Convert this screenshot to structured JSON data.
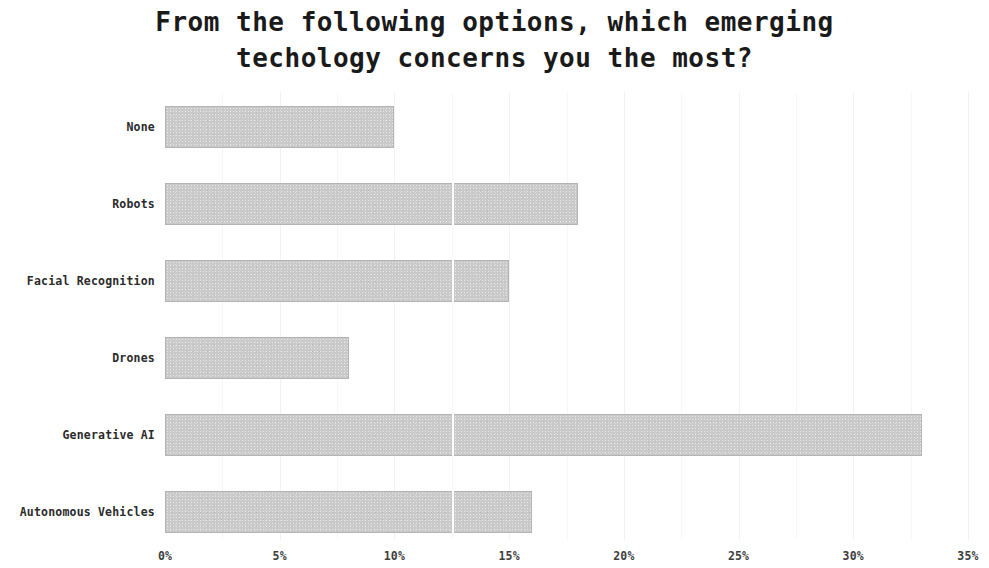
{
  "chart_data": {
    "type": "bar",
    "orientation": "horizontal",
    "title": "From the following options, which emerging\ntechology concerns you the most?",
    "title_line1": "From the following options, which emerging",
    "title_line2": "techology concerns you the most?",
    "xlabel": "",
    "ylabel": "",
    "categories": [
      "None",
      "Robots",
      "Facial Recognition",
      "Drones",
      "Generative AI",
      "Autonomous Vehicles"
    ],
    "values": [
      10,
      18,
      15,
      8,
      33,
      16
    ],
    "value_labels": [
      "10%",
      "18%",
      "15%",
      "8%",
      "33%",
      "16%"
    ],
    "xlim": [
      0,
      35
    ],
    "xtick_values": [
      0,
      5,
      10,
      15,
      20,
      25,
      30,
      35
    ],
    "xtick_labels": [
      "0%",
      "5%",
      "10%",
      "15%",
      "20%",
      "25%",
      "30%",
      "35%"
    ],
    "grid": true,
    "grid_axis": "x",
    "gridline_values": [
      2.5,
      5,
      7.5,
      10,
      12.5,
      15,
      17.5,
      20,
      22.5,
      25,
      27.5,
      30,
      32.5,
      35
    ],
    "legend": null,
    "bar_color": "#c9c9c9",
    "bar_edge_color": "#b4b4b4",
    "grid_color": "#f2f2f2",
    "background_color": "#ffffff",
    "text_color": "#262626"
  }
}
